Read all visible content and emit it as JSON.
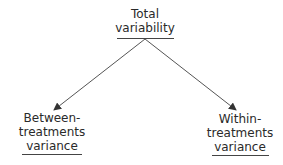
{
  "diagram": {
    "type": "tree",
    "colors": {
      "text": "#2a2a2a",
      "lines": "#444444",
      "background": "#ffffff"
    },
    "root": {
      "id": "total",
      "lines": [
        "Total",
        "variability"
      ]
    },
    "children": [
      {
        "id": "between",
        "lines": [
          "Between-",
          "treatments",
          "variance"
        ]
      },
      {
        "id": "within",
        "lines": [
          "Within-",
          "treatments",
          "variance"
        ]
      }
    ],
    "edges": [
      {
        "from": "total",
        "to": "between"
      },
      {
        "from": "total",
        "to": "within"
      }
    ]
  }
}
